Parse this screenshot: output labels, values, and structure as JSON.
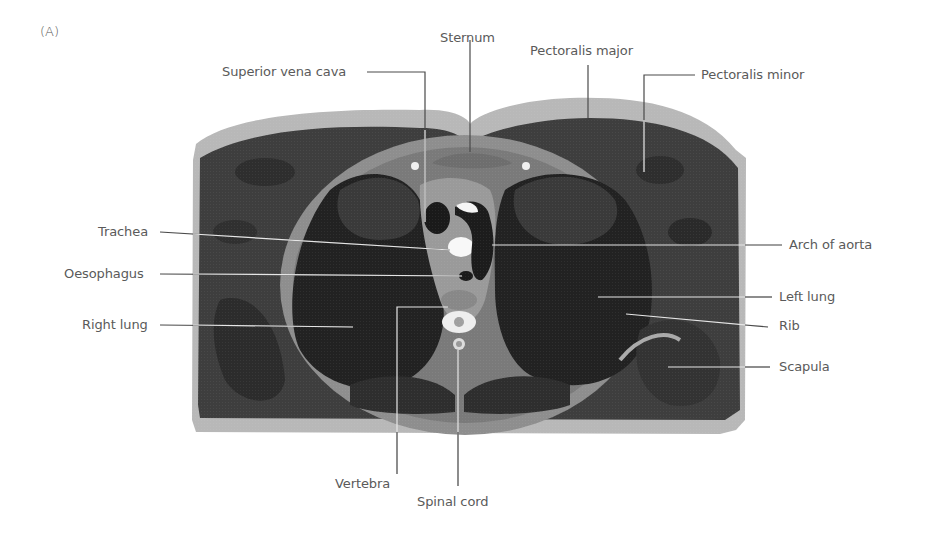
{
  "figure": {
    "panel_label": "(A)",
    "colors": {
      "background": "#ffffff",
      "skin_fat": "#b4b4b4",
      "muscle": "#3c3c3c",
      "lung": "#1e1e1e",
      "fascia": "#9a9a9a",
      "bone_marrow": "#f2f2f2",
      "label_text": "#5a5a5a",
      "leader_line_dark": "#4a4a4a",
      "leader_line_light": "#e6e6e6"
    }
  },
  "labels": {
    "left": [
      {
        "id": "superior-vena-cava",
        "text": "Superior vena cava"
      },
      {
        "id": "trachea",
        "text": "Trachea"
      },
      {
        "id": "oesophagus",
        "text": "Oesophagus"
      },
      {
        "id": "right-lung",
        "text": "Right lung"
      }
    ],
    "top": [
      {
        "id": "sternum",
        "text": "Sternum"
      },
      {
        "id": "pectoralis-major",
        "text": "Pectoralis major"
      },
      {
        "id": "pectoralis-minor",
        "text": "Pectoralis minor"
      }
    ],
    "right": [
      {
        "id": "arch-of-aorta",
        "text": "Arch of aorta"
      },
      {
        "id": "left-lung",
        "text": "Left lung"
      },
      {
        "id": "rib",
        "text": "Rib"
      },
      {
        "id": "scapula",
        "text": "Scapula"
      }
    ],
    "bottom": [
      {
        "id": "vertebra",
        "text": "Vertebra"
      },
      {
        "id": "spinal-cord",
        "text": "Spinal cord"
      }
    ]
  }
}
